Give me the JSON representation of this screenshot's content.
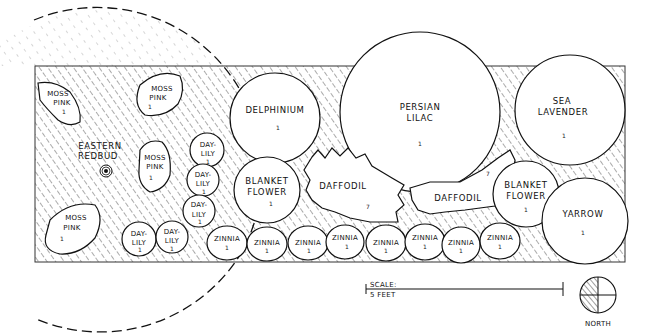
{
  "diagram": {
    "type": "garden-planting-plan",
    "colors": {
      "ink": "#111111",
      "background": "#ffffff",
      "hatch": "#444444"
    },
    "plants": [
      {
        "id": "moss-pink-1",
        "label": [
          "MOSS",
          "PINK"
        ],
        "qty": "1"
      },
      {
        "id": "moss-pink-2",
        "label": [
          "MOSS",
          "PINK"
        ],
        "qty": "1"
      },
      {
        "id": "moss-pink-3",
        "label": [
          "MOSS",
          "PINK"
        ],
        "qty": "1"
      },
      {
        "id": "moss-pink-4",
        "label": [
          "MOSS",
          "PINK"
        ],
        "qty": "1"
      },
      {
        "id": "eastern-redbud",
        "label": [
          "EASTERN",
          "REDBUD"
        ]
      },
      {
        "id": "day-lily-1",
        "label": [
          "DAY-",
          "LILY"
        ],
        "qty": "1"
      },
      {
        "id": "day-lily-2",
        "label": [
          "DAY-",
          "LILY"
        ],
        "qty": "1"
      },
      {
        "id": "day-lily-3",
        "label": [
          "DAY-",
          "LILY"
        ],
        "qty": "1"
      },
      {
        "id": "day-lily-4",
        "label": [
          "DAY-",
          "LILY"
        ],
        "qty": "1"
      },
      {
        "id": "day-lily-5",
        "label": [
          "DAY-",
          "LILY"
        ],
        "qty": "1"
      },
      {
        "id": "delphinium",
        "label": [
          "DELPHINIUM"
        ],
        "qty": "1"
      },
      {
        "id": "persian-lilac",
        "label": [
          "PERSIAN",
          "LILAC"
        ],
        "qty": "1"
      },
      {
        "id": "sea-lavender",
        "label": [
          "SEA",
          "LAVENDER"
        ],
        "qty": "1"
      },
      {
        "id": "blanket-flower-1",
        "label": [
          "BLANKET",
          "FLOWER"
        ],
        "qty": "1"
      },
      {
        "id": "blanket-flower-2",
        "label": [
          "BLANKET",
          "FLOWER"
        ],
        "qty": "1"
      },
      {
        "id": "daffodil-1",
        "label": [
          "DAFFODIL"
        ],
        "qty": "7"
      },
      {
        "id": "daffodil-2",
        "label": [
          "DAFFODIL"
        ],
        "qty": "7"
      },
      {
        "id": "yarrow",
        "label": [
          "YARROW"
        ],
        "qty": "1"
      },
      {
        "id": "zinnia-1",
        "label": [
          "ZINNIA"
        ],
        "qty": "1"
      },
      {
        "id": "zinnia-2",
        "label": [
          "ZINNIA"
        ],
        "qty": "1"
      },
      {
        "id": "zinnia-3",
        "label": [
          "ZINNIA"
        ],
        "qty": "1"
      },
      {
        "id": "zinnia-4",
        "label": [
          "ZINNIA"
        ],
        "qty": "1"
      },
      {
        "id": "zinnia-5",
        "label": [
          "ZINNIA"
        ],
        "qty": "1"
      },
      {
        "id": "zinnia-6",
        "label": [
          "ZINNIA"
        ],
        "qty": "1"
      },
      {
        "id": "zinnia-7",
        "label": [
          "ZINNIA"
        ],
        "qty": "1"
      },
      {
        "id": "zinnia-8",
        "label": [
          "ZINNIA"
        ],
        "qty": "1"
      }
    ],
    "scale": {
      "line1": "SCALE:",
      "line2": "5 FEET"
    },
    "compass": {
      "label": "NORTH"
    }
  }
}
